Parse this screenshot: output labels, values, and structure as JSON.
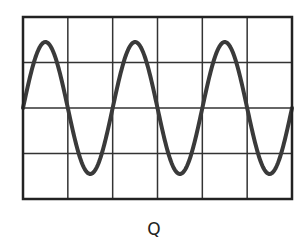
{
  "figure": {
    "label": "Q",
    "grid": {
      "left": 23,
      "top": 17,
      "right": 292,
      "bottom": 199,
      "columns": 6,
      "rows": 4,
      "border_color": "#222222",
      "line_color": "#333333"
    },
    "waveform": {
      "type": "sine",
      "cycles": 3,
      "start_phase": "zero-crossing-rising",
      "amplitude_divisions": 1.45,
      "period_divisions": 2,
      "stroke_color": "#3a3a3a",
      "stroke_width": 4
    }
  }
}
